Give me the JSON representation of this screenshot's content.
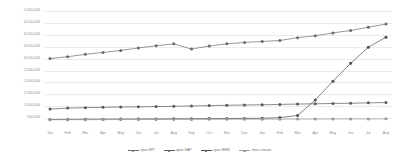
{
  "chart_data": {
    "type": "line",
    "title": "",
    "xlabel": "",
    "ylabel": "",
    "grid": true,
    "legend_position": "bottom",
    "ylim": [
      0,
      5000000
    ],
    "ytick_labels": [
      "5,000,000",
      "4,500,000",
      "4,000,000",
      "3,500,000",
      "3,000,000",
      "2,500,000",
      "2,000,000",
      "1,500,000",
      "1,000,000",
      "500,000"
    ],
    "ytick_values": [
      5000000,
      4500000,
      4000000,
      3500000,
      3000000,
      2500000,
      2000000,
      1500000,
      1000000,
      500000
    ],
    "categories": [
      "Jan",
      "Feb",
      "Mar",
      "Apr",
      "May",
      "Jun",
      "Jul",
      "Aug",
      "Sep",
      "Oct",
      "Nov",
      "Dec",
      "Jan",
      "Feb",
      "Mar",
      "Apr",
      "May",
      "Jun",
      "Jul",
      "Aug"
    ],
    "series": [
      {
        "name": "oper-HPI",
        "color": "#6b6b6b",
        "values": [
          3000000,
          3080000,
          3180000,
          3260000,
          3340000,
          3450000,
          3540000,
          3620000,
          3400000,
          3530000,
          3620000,
          3680000,
          3720000,
          3760000,
          3880000,
          3960000,
          4080000,
          4180000,
          4320000,
          4450000
        ]
      },
      {
        "name": "oper-SAP",
        "color": "#5a5a5a",
        "values": [
          880000,
          920000,
          940000,
          955000,
          965000,
          975000,
          985000,
          995000,
          1010000,
          1025000,
          1040000,
          1050000,
          1060000,
          1075000,
          1090000,
          1100000,
          1115000,
          1125000,
          1140000,
          1155000
        ]
      },
      {
        "name": "oper-WHD",
        "color": "#4d4d4d",
        "values": [
          440000,
          445000,
          450000,
          455000,
          458000,
          462000,
          466000,
          470000,
          474000,
          478000,
          482000,
          486000,
          492000,
          520000,
          610000,
          1260000,
          2050000,
          2800000,
          3480000,
          3900000
        ]
      },
      {
        "name": "mocc-house",
        "color": "#9a9a9a",
        "values": [
          430000,
          432000,
          434000,
          436000,
          438000,
          440000,
          442000,
          444000,
          446000,
          448000,
          450000,
          452000,
          454000,
          456000,
          458000,
          460000,
          462000,
          464000,
          466000,
          468000
        ]
      }
    ]
  }
}
